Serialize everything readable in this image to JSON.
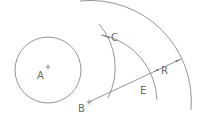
{
  "diagram": {
    "type": "geometric-construction",
    "points": {
      "A": {
        "label": "A",
        "x": 48,
        "y": 68
      },
      "B": {
        "label": "B",
        "x": 89,
        "y": 102
      }
    },
    "labels": {
      "A": "A",
      "B": "B",
      "C": "C",
      "E": "E",
      "R": "R"
    },
    "shapes": {
      "circle_A": {
        "cx": 48,
        "cy": 70,
        "r": 33
      },
      "arc_about_A": {
        "center": "A",
        "r": 67
      },
      "arc_E_about_B": {
        "center": "B",
        "r": 69
      },
      "arc_outer_about_B": {
        "center": "B",
        "r": 101
      },
      "radius_line": {
        "from": "B",
        "to": "outer arc",
        "dimension_label": "R"
      }
    },
    "colors": {
      "line": "#7a7a7a",
      "text": "#6a6a6a",
      "background": "#ffffff"
    }
  }
}
